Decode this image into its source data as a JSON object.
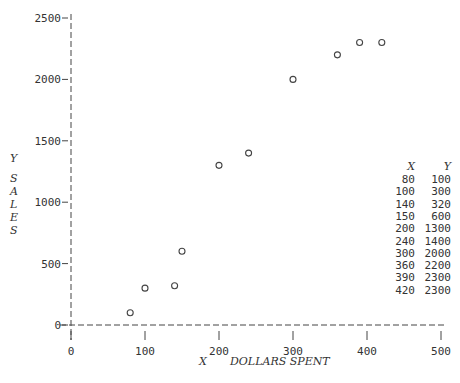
{
  "chart_data": {
    "type": "scatter",
    "title": "",
    "xlabel": "X   DOLLARS SPENT",
    "ylabel": "Y SALES",
    "xlim": [
      0,
      500
    ],
    "ylim": [
      0,
      2500
    ],
    "x_ticks": [
      0,
      100,
      200,
      300,
      400,
      500
    ],
    "y_ticks": [
      0,
      500,
      1000,
      1500,
      2000,
      2500
    ],
    "grid": false,
    "legend": null,
    "marker": "open-circle",
    "x": [
      80,
      100,
      140,
      150,
      200,
      240,
      300,
      360,
      390,
      420
    ],
    "y": [
      100,
      300,
      320,
      600,
      1300,
      1400,
      2000,
      2200,
      2300,
      2300
    ],
    "table": {
      "headers": [
        "X",
        "Y"
      ],
      "rows": [
        [
          "80",
          "100"
        ],
        [
          "100",
          "300"
        ],
        [
          "140",
          "320"
        ],
        [
          "150",
          "600"
        ],
        [
          "200",
          "1300"
        ],
        [
          "240",
          "1400"
        ],
        [
          "300",
          "2000"
        ],
        [
          "360",
          "2200"
        ],
        [
          "390",
          "2300"
        ],
        [
          "420",
          "2300"
        ]
      ]
    }
  },
  "labels": {
    "y_axis_letter": "Y",
    "y_axis_word": [
      "S",
      "A",
      "L",
      "E",
      "S"
    ],
    "x_axis_letter": "X",
    "x_axis_word": "DOLLARS SPENT"
  }
}
